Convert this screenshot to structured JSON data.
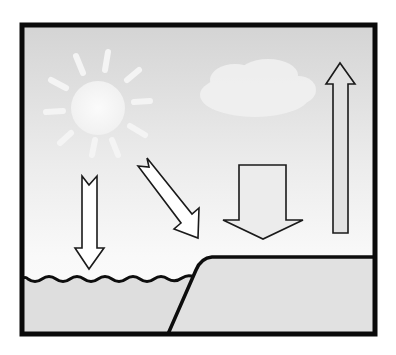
{
  "diagram": {
    "type": "illustration",
    "elements": [
      {
        "id": "sun",
        "kind": "sun",
        "description": "faint white sun with rays, upper left"
      },
      {
        "id": "cloud",
        "kind": "cloud",
        "description": "faint white cloud, upper center"
      },
      {
        "id": "arrow-down-water",
        "kind": "arrow",
        "direction": "down",
        "description": "narrow arrow pointing down onto water"
      },
      {
        "id": "arrow-diagonal",
        "kind": "arrow",
        "direction": "down-right",
        "description": "diagonal arrow pointing toward shoreline"
      },
      {
        "id": "arrow-down-land",
        "kind": "arrow",
        "direction": "down",
        "description": "wide arrow pointing down onto land"
      },
      {
        "id": "arrow-up",
        "kind": "arrow",
        "direction": "up",
        "description": "tall narrow arrow pointing upward, right side"
      },
      {
        "id": "water",
        "kind": "surface",
        "description": "water body with wavy surface, lower left"
      },
      {
        "id": "land",
        "kind": "surface",
        "description": "raised land/cliff, lower right"
      }
    ]
  },
  "colors": {
    "frame": "#0a0a0a",
    "sky_top": "#d6d6d6",
    "sky_bottom": "#fbfbfb",
    "sun": "#f7f7f7",
    "arrow_fill_light": "#ffffff",
    "arrow_fill_gray": "#e2e2e2",
    "water": "#dedede",
    "land": "#e0e0e0",
    "outline": "#1a1a1a"
  }
}
